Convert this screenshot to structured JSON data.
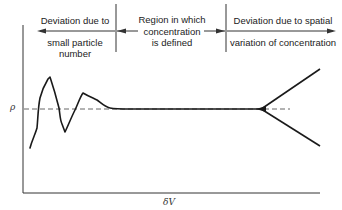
{
  "diagram": {
    "regions": [
      {
        "id": "left",
        "top_label": "Deviation due to",
        "bottom_label": "small particle number",
        "bottom_lines": [
          "small particle",
          "number"
        ],
        "arrow_direction": "left"
      },
      {
        "id": "middle",
        "label_lines": [
          "Region in which",
          "concentration",
          "is defined"
        ],
        "arrow_direction": "both"
      },
      {
        "id": "right",
        "top_label": "Deviation due to spatial",
        "bottom_label": "variation of concentration",
        "arrow_direction": "right"
      }
    ],
    "y_axis_label": "ρ",
    "x_axis_label": "δV",
    "reference_line": "dashed horizontal line at ρ",
    "curve_description": "Density oscillates strongly at small δV, converges to ρ in the middle region, then diverges into two branches at large δV"
  }
}
